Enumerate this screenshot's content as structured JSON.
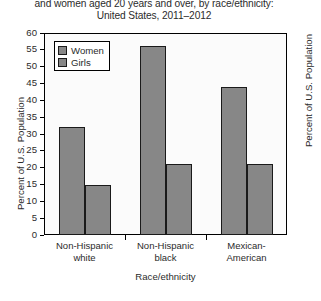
{
  "chart_data": {
    "type": "bar",
    "title": "and women aged 20 years and over, by race/ethnicity: United States, 2011–2012",
    "title_lines": [
      "and women aged 20 years and over, by race/ethnicity:",
      "United States, 2011–2012"
    ],
    "categories": [
      "Non-Hispanic white",
      "Non-Hispanic black",
      "Mexican-American"
    ],
    "category_lines": [
      [
        "Non-Hispanic",
        "white"
      ],
      [
        "Non-Hispanic",
        "black"
      ],
      [
        "Mexican-",
        "American"
      ]
    ],
    "series": [
      {
        "name": "Women",
        "values": [
          32,
          56,
          44
        ]
      },
      {
        "name": "Girls",
        "values": [
          15,
          21,
          21
        ]
      }
    ],
    "xlabel": "Race/ethnicity",
    "ylabel": "Percent of U.S. Population",
    "ylabel_right": "Percent of U.S. Population",
    "ylim": [
      0,
      60
    ],
    "yticks": [
      60,
      55,
      50,
      45,
      40,
      35,
      30,
      25,
      20,
      15,
      10,
      5,
      0
    ],
    "ytick_step": 5,
    "grid": false,
    "legend_position": "upper-left-inside",
    "bar_color": "#878787",
    "bar_edge_color": "#1a1a1a",
    "plot_background": "#fbfbfb",
    "text_color": "#2b2b2b"
  }
}
